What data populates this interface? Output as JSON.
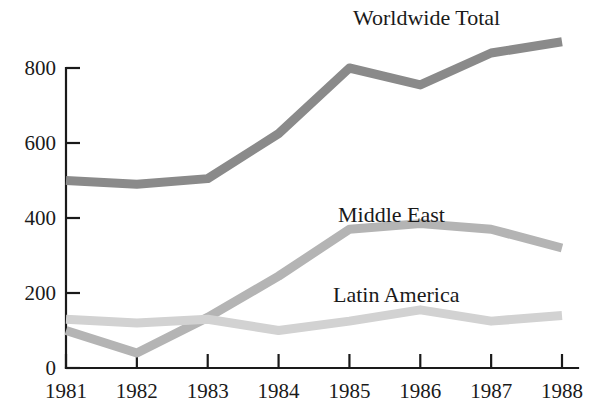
{
  "chart_data": {
    "type": "line",
    "title": "",
    "subtitle": "",
    "xlabel": "",
    "ylabel": "",
    "categories": [
      "1981",
      "1982",
      "1983",
      "1984",
      "1985",
      "1986",
      "1987",
      "1988"
    ],
    "x": [
      1981,
      1982,
      1983,
      1984,
      1985,
      1986,
      1987,
      1988
    ],
    "xlim": [
      1981,
      1988
    ],
    "ylim": [
      0,
      900
    ],
    "y_ticks": [
      0,
      200,
      400,
      600,
      800
    ],
    "y_tick_labels": [
      "0",
      "200",
      "400",
      "600",
      "800"
    ],
    "grid": false,
    "legend_position": "inline-annotations",
    "series": [
      {
        "name": "Worldwide Total",
        "color": "#8a8a8a",
        "stroke_width": 9,
        "label_x": 1985,
        "label_y": 900,
        "values": [
          500,
          490,
          505,
          625,
          800,
          755,
          840,
          870
        ]
      },
      {
        "name": "Middle East",
        "color": "#b4b4b4",
        "stroke_width": 9,
        "label_x": 1985,
        "label_y": 440,
        "values": [
          100,
          40,
          135,
          245,
          370,
          385,
          370,
          320
        ]
      },
      {
        "name": "Latin America",
        "color": "#d2d2d2",
        "stroke_width": 9,
        "label_x": 1985,
        "label_y": 215,
        "values": [
          130,
          120,
          130,
          100,
          125,
          155,
          125,
          140
        ]
      }
    ],
    "annotations": [
      {
        "text": "Worldwide Total",
        "x_px": 353,
        "y_px": 25
      },
      {
        "text": "Middle East",
        "x_px": 338,
        "y_px": 222
      },
      {
        "text": "Latin America",
        "x_px": 333,
        "y_px": 302
      }
    ]
  },
  "axes": {
    "y_axis_name": "value-axis",
    "x_axis_name": "year-axis",
    "origin_px": {
      "x": 66,
      "y": 368
    },
    "x_end_px": 578,
    "y_top_px": 60,
    "px_per_unit": 0.375,
    "px_per_year": 70.857
  }
}
